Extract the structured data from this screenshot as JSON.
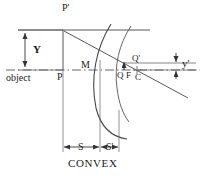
{
  "diagram": {
    "title": "CONVEX",
    "type": "optics-ray-diagram",
    "stroke_color": "#333333",
    "text_color": "#1a1a1a",
    "background": "#ffffff",
    "labels": {
      "object_point_top": "P'",
      "object_point_base": "P",
      "object_word": "object",
      "object_height": "Y",
      "mirror": "M",
      "image_point_top": "Q'",
      "image_point_base": "Q",
      "focal_point": "F",
      "center_of_curvature": "C",
      "image_height": "y'",
      "object_distance": "S",
      "image_distance": "S'",
      "caption": "CONVEX"
    },
    "label_positions": {
      "object_point_top": {
        "x": 62,
        "y": 4
      },
      "object_word": {
        "x": 6,
        "y": 74
      },
      "object_point_base": {
        "x": 60,
        "y": 72
      },
      "object_height": {
        "x": 33,
        "y": 44
      },
      "mirror": {
        "x": 82,
        "y": 62
      },
      "image_point_top": {
        "x": 133,
        "y": 55
      },
      "image_point_base": {
        "x": 116,
        "y": 72
      },
      "focal_point": {
        "x": 126,
        "y": 72
      },
      "center_of_curvature": {
        "x": 136,
        "y": 73
      },
      "image_height": {
        "x": 181,
        "y": 58
      },
      "object_distance": {
        "x": 78,
        "y": 144
      },
      "image_distance": {
        "x": 106,
        "y": 144
      },
      "caption": {
        "x": 70,
        "y": 160
      }
    },
    "geometry": {
      "axis_y": 70,
      "top_ray_y": 30,
      "object_x": 63,
      "mirror_vertex_x": 100,
      "focus_x": 127,
      "center_x": 137,
      "image_top_y": 63,
      "dim_baseline_y": 147
    }
  }
}
